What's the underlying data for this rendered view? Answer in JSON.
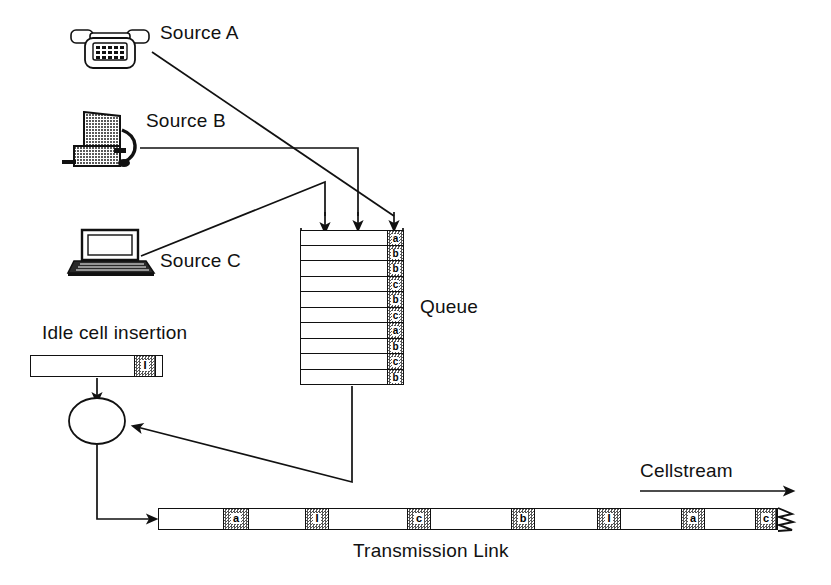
{
  "diagram": {
    "title_labels": {
      "source_a": "Source A",
      "source_b": "Source B",
      "source_c": "Source C",
      "queue": "Queue",
      "idle": "Idle cell insertion",
      "cellstream": "Cellstream",
      "link": "Transmission Link"
    },
    "icons": {
      "source_a": "telephone-icon",
      "source_b": "fax-machine-icon",
      "source_c": "laptop-computer-icon",
      "multiplexer": "multiplexer-circle-icon"
    },
    "queue": {
      "rows": 10,
      "cells": [
        "a",
        "b",
        "b",
        "c",
        "b",
        "c",
        "a",
        "b",
        "c",
        "b"
      ]
    },
    "idle_cell": {
      "label": "I"
    },
    "transmission_link": {
      "cells": [
        {
          "label": "a",
          "left": 64,
          "width": 26
        },
        {
          "label": "I",
          "left": 146,
          "width": 24
        },
        {
          "label": "c",
          "left": 248,
          "width": 24
        },
        {
          "label": "b",
          "left": 352,
          "width": 24
        },
        {
          "label": "I",
          "left": 438,
          "width": 24
        },
        {
          "label": "a",
          "left": 522,
          "width": 24
        },
        {
          "label": "c",
          "left": 596,
          "width": 22
        }
      ]
    },
    "colors": {
      "stroke": "#111111",
      "background": "#ffffff",
      "cell_fill": "#8a8a8a"
    }
  }
}
